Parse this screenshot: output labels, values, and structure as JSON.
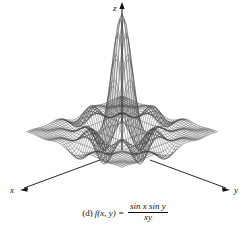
{
  "figure": {
    "label": "(d)",
    "function_prefix": "f(x, y) =",
    "numerator": "sin x sin y",
    "denominator": "xy",
    "caption_full": "(d) f(x, y) = sin x sin y / xy",
    "background_color": "#ffffff",
    "mesh_color": "#3a3a3a",
    "axis_color": "#111111"
  },
  "axes": {
    "x_label": "x",
    "y_label": "y",
    "z_label": "z"
  },
  "chart_data": {
    "type": "surface",
    "title": "",
    "subtitle": "",
    "xlabel": "x",
    "ylabel": "y",
    "zlabel": "z",
    "function": "sin(x)*sin(y)/(x*y)",
    "xlim": [
      -12,
      12
    ],
    "ylim": [
      -12,
      12
    ],
    "zlim": [
      -0.25,
      1.0
    ],
    "grid": true,
    "legend": false,
    "render": "wireframe",
    "mesh_n": 46,
    "peak_value": 1.0,
    "peak_at": [
      0,
      0
    ],
    "projection": {
      "azimuth_deg": 45,
      "elevation_deg": 22,
      "scale_x": 5.6,
      "scale_y": 5.6,
      "scale_z": 118
    }
  }
}
